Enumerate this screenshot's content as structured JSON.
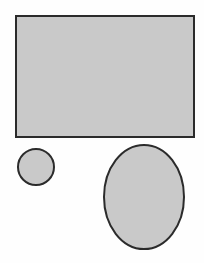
{
  "canvas": {
    "width": 204,
    "height": 263,
    "background_color": "#fefefe"
  },
  "style": {
    "fill_color": "#c9c9c9",
    "stroke_color": "#2b2b2b",
    "stroke_width": 2
  },
  "shapes": [
    {
      "name": "rectangle",
      "kind": "rectangle",
      "x": 16,
      "y": 16,
      "width": 178,
      "height": 121,
      "fill": "#c9c9c9",
      "stroke": "#2b2b2b",
      "stroke_width": 2
    },
    {
      "name": "small-circle",
      "kind": "circle",
      "cx": 36,
      "cy": 167,
      "r": 18,
      "fill": "#c9c9c9",
      "stroke": "#2b2b2b",
      "stroke_width": 2
    },
    {
      "name": "large-ellipse",
      "kind": "ellipse",
      "cx": 144,
      "cy": 197,
      "rx": 40,
      "ry": 52,
      "fill": "#c9c9c9",
      "stroke": "#2b2b2b",
      "stroke_width": 2
    }
  ]
}
